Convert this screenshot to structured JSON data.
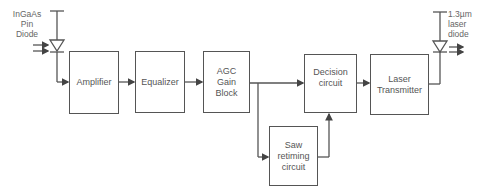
{
  "diagram": {
    "input_label": [
      "InGaAs",
      "Pin",
      "Diode"
    ],
    "output_label": [
      "1.3µm",
      "laser",
      "diode"
    ],
    "blocks": {
      "amplifier": "Amplifier",
      "equalizer": "Equalizer",
      "agc": "AGC Gain Block",
      "decision": "Decision circuit",
      "laser_tx": "Laser Transmitter",
      "saw": "Saw retiming circuit"
    },
    "connections": [
      [
        "InGaAs Pin Diode",
        "Amplifier"
      ],
      [
        "Amplifier",
        "Equalizer"
      ],
      [
        "Equalizer",
        "AGC Gain Block"
      ],
      [
        "AGC Gain Block",
        "Decision circuit"
      ],
      [
        "AGC Gain Block",
        "Saw retiming circuit"
      ],
      [
        "Saw retiming circuit",
        "Decision circuit"
      ],
      [
        "Decision circuit",
        "Laser Transmitter"
      ],
      [
        "Laser Transmitter",
        "1.3µm laser diode"
      ]
    ],
    "line_color": "#555555"
  }
}
